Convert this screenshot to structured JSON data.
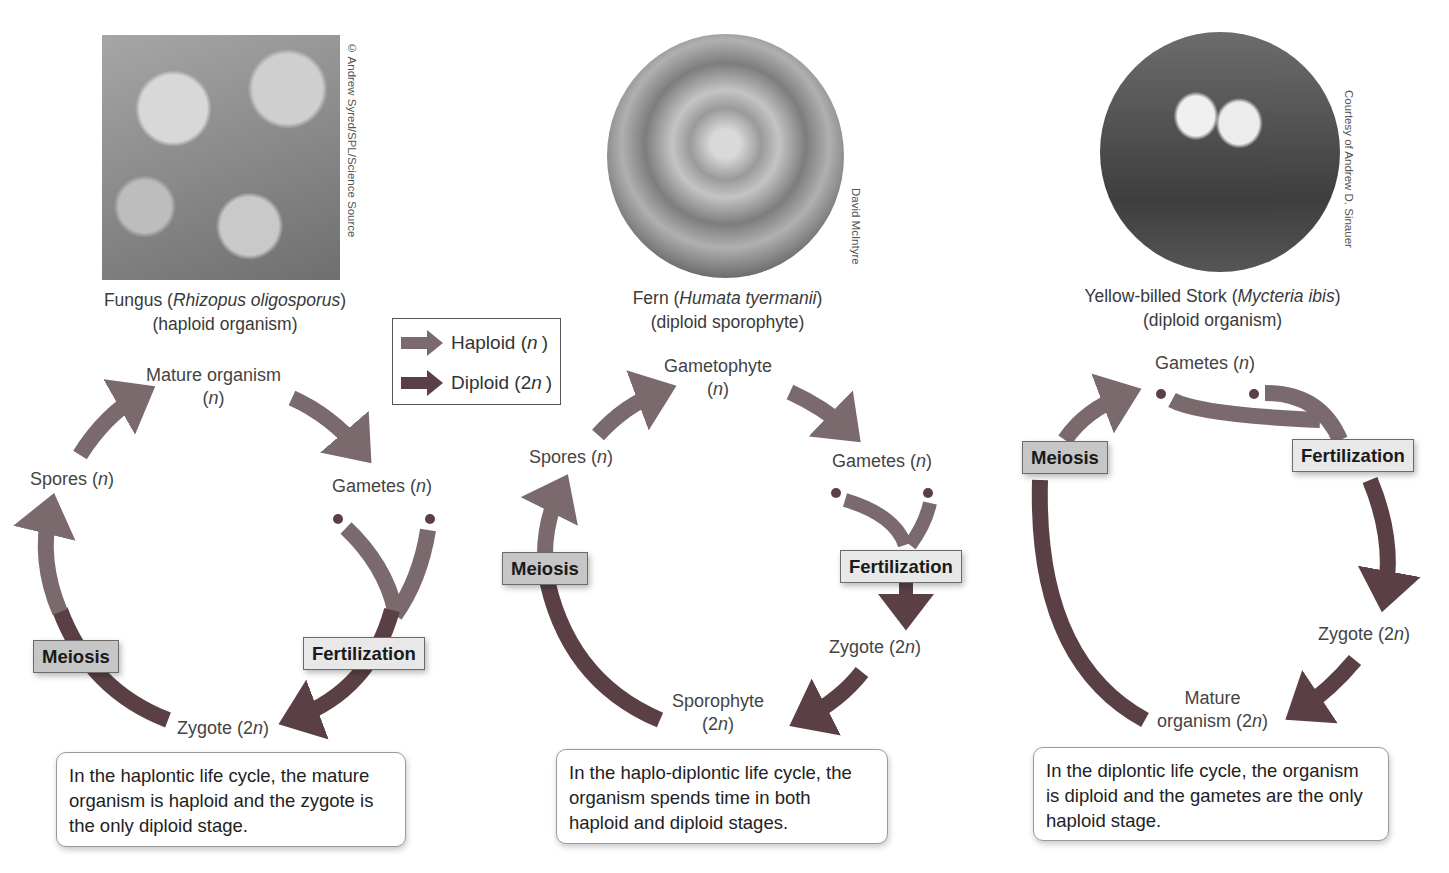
{
  "colors": {
    "haploid_arrow": "#7a6a6d",
    "diploid_arrow": "#5a4045",
    "meiosis_label_bg": "#c6c6c6",
    "fertilization_label_bg": "#e8e8e8",
    "text": "#3a3a3a"
  },
  "legend": {
    "haploid_label": "Haploid (n)",
    "haploid_prefix": "Haploid (",
    "haploid_var": "n",
    "haploid_suffix": ")",
    "diploid_prefix": "Diploid (2",
    "diploid_var": "n",
    "diploid_suffix": ")",
    "haploid_icon": "haploid-arrow-icon",
    "diploid_icon": "diploid-arrow-icon"
  },
  "panels": [
    {
      "id": "haplontic",
      "photo_credit": "© Andrew Syred/SPL/Science Source",
      "organism_common": "Fungus (",
      "organism_sci": "Rhizopus oligosporus",
      "organism_close": ")",
      "organism_type": "(haploid organism)",
      "stages": {
        "top": "Mature organism",
        "top_n": "(n)",
        "left": "Spores (",
        "right": "Gametes (",
        "bottom": "Zygote (2"
      },
      "processes": {
        "meiosis": "Meiosis",
        "fertilization": "Fertilization"
      },
      "description": "In the haplontic life cycle, the mature organism is haploid and the zygote is the only diploid stage."
    },
    {
      "id": "haplo-diplontic",
      "photo_credit": "David McIntyre",
      "organism_common": "Fern (",
      "organism_sci": "Humata tyermanii",
      "organism_close": ")",
      "organism_type": "(diploid sporophyte)",
      "stages": {
        "top": "Gametophyte",
        "left": "Spores (",
        "right": "Gametes (",
        "zygote": "Zygote (2",
        "bottom": "Sporophyte"
      },
      "processes": {
        "meiosis": "Meiosis",
        "fertilization": "Fertilization"
      },
      "description": "In the haplo-diplontic life cycle, the organism spends time in both haploid and diploid stages."
    },
    {
      "id": "diplontic",
      "photo_credit": "Courtesy of Andrew D. Sinauer",
      "organism_common": "Yellow-billed Stork (",
      "organism_sci": "Mycteria ibis",
      "organism_close": ")",
      "organism_type": "(diploid organism)",
      "stages": {
        "top": "Gametes (",
        "zygote": "Zygote (2",
        "bottom_line1": "Mature",
        "bottom_line2": "organism (2"
      },
      "processes": {
        "meiosis": "Meiosis",
        "fertilization": "Fertilization"
      },
      "description": "In the diplontic life cycle, the organism is diploid and the gametes are the only haploid stage."
    }
  ],
  "symbols": {
    "n": "n",
    "close": ")",
    "two_n_open": "(2",
    "n_open": "("
  }
}
